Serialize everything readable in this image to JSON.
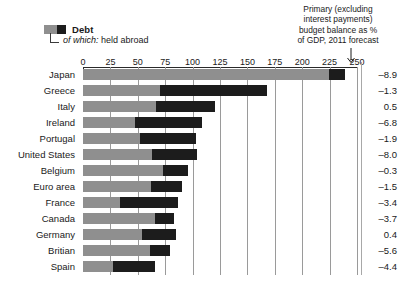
{
  "legend": {
    "series_label": "Debt",
    "sub_prefix": "of which:",
    "sub_label": "held abroad",
    "sub_full": "of which: held abroad",
    "color_debt": "#8f8f8f",
    "color_abroad": "#1c1c1c"
  },
  "annotation": {
    "line1": "Primary (excluding",
    "line2": "interest payments)",
    "line3": "budget balance as %",
    "line4": "of GDP, 2011 forecast",
    "arrow_icon": "down-arrow-icon"
  },
  "chart_data": {
    "type": "bar",
    "orientation": "horizontal",
    "title": "",
    "xlabel": "",
    "ylabel": "",
    "xlim": [
      0,
      250
    ],
    "xticks": [
      0,
      25,
      50,
      75,
      100,
      125,
      150,
      175,
      200,
      225,
      250
    ],
    "grid": true,
    "legend_position": "top-left",
    "categories": [
      "Japan",
      "Greece",
      "Italy",
      "Ireland",
      "Portugal",
      "United States",
      "Belgium",
      "Euro area",
      "France",
      "Canada",
      "Germany",
      "Britian",
      "Spain"
    ],
    "series": [
      {
        "name": "Debt",
        "values": [
          239,
          168,
          120,
          109,
          103,
          104,
          96,
          90,
          87,
          83,
          85,
          79,
          66
        ]
      },
      {
        "name": "of which: held abroad",
        "values": [
          15,
          98,
          53,
          62,
          51,
          41,
          23,
          28,
          53,
          17,
          31,
          18,
          39
        ],
        "starts": [
          224,
          70,
          67,
          47,
          52,
          63,
          73,
          62,
          34,
          66,
          54,
          61,
          27
        ]
      }
    ],
    "annotations": {
      "name": "Primary (excluding interest payments) budget balance as % of GDP, 2011 forecast",
      "values": [
        -8.9,
        -1.3,
        0.5,
        -6.8,
        -1.9,
        -8.0,
        -0.3,
        -1.5,
        -3.4,
        -3.7,
        0.4,
        -5.6,
        -4.4
      ],
      "labels": [
        "–8.9",
        "–1.3",
        "0.5",
        "–6.8",
        "–1.9",
        "–8.0",
        "–0.3",
        "–1.5",
        "–3.4",
        "–3.7",
        "0.4",
        "–5.6",
        "–4.4"
      ]
    }
  }
}
